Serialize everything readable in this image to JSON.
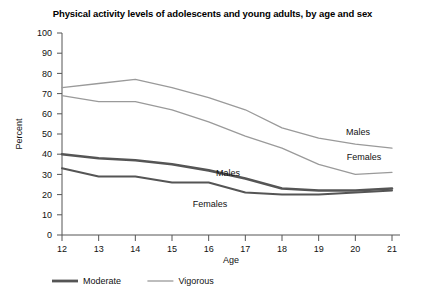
{
  "chart_data": {
    "type": "line",
    "title": "Physical activity levels of adolescents and young adults, by age and sex",
    "xlabel": "Age",
    "ylabel": "Percent",
    "x": [
      12,
      13,
      14,
      15,
      16,
      17,
      18,
      19,
      20,
      21
    ],
    "xtick_labels": [
      "12",
      "13",
      "14",
      "15",
      "16",
      "17",
      "18",
      "19",
      "20",
      "21"
    ],
    "ytick_labels": [
      "0",
      "10",
      "20",
      "30",
      "40",
      "50",
      "60",
      "70",
      "80",
      "90",
      "100"
    ],
    "ylim": [
      0,
      100
    ],
    "xlim": [
      12,
      21
    ],
    "ytick_step": 10,
    "grid": false,
    "legend_position": "bottom-left",
    "series": [
      {
        "name": "Vigorous Males",
        "activity": "Vigorous",
        "sex": "Males",
        "values": [
          73,
          75,
          77,
          73,
          68,
          62,
          53,
          48,
          45,
          43
        ],
        "color": "#9a9a9a",
        "width": 1.3
      },
      {
        "name": "Vigorous Females",
        "activity": "Vigorous",
        "sex": "Females",
        "values": [
          69,
          66,
          66,
          62,
          56,
          49,
          43,
          35,
          30,
          31
        ],
        "color": "#9a9a9a",
        "width": 1.3
      },
      {
        "name": "Moderate Males",
        "activity": "Moderate",
        "sex": "Males",
        "values": [
          40,
          38,
          37,
          35,
          32,
          28,
          23,
          22,
          22,
          23
        ],
        "color": "#555555",
        "width": 2.6
      },
      {
        "name": "Moderate Females",
        "activity": "Moderate",
        "sex": "Females",
        "values": [
          33,
          29,
          29,
          26,
          26,
          21,
          20,
          20,
          21,
          22
        ],
        "color": "#555555",
        "width": 2.0
      }
    ],
    "annotations": [
      {
        "text": "Males",
        "series": "Vigorous Males",
        "x_px": 358,
        "y_px": 135
      },
      {
        "text": "Females",
        "series": "Vigorous Females",
        "x_px": 364,
        "y_px": 160
      },
      {
        "text": "Males",
        "series": "Moderate Males",
        "x_px": 228,
        "y_px": 176
      },
      {
        "text": "Females",
        "series": "Moderate Females",
        "x_px": 210,
        "y_px": 207
      }
    ]
  },
  "legend": {
    "items": [
      {
        "label": "Moderate",
        "color": "#555555",
        "width": 2.8
      },
      {
        "label": "Vigorous",
        "color": "#9a9a9a",
        "width": 1.3
      }
    ]
  }
}
